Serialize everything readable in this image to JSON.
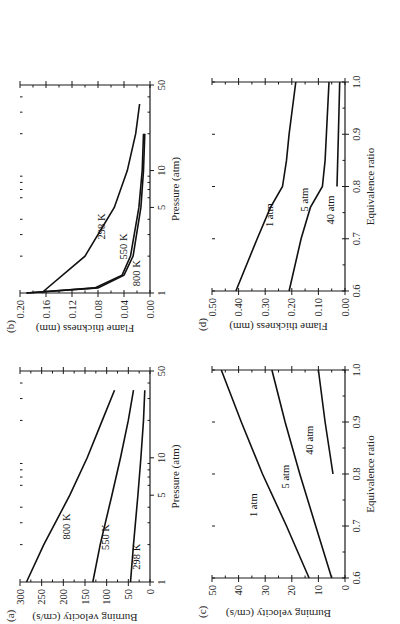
{
  "page": {
    "orientation": "rotated-90-ccw",
    "caption_visible": false
  },
  "chart_data": [
    {
      "id": "a",
      "panel_label": "(a)",
      "type": "line",
      "xlabel": "Pressure (atm)",
      "ylabel": "Burning velocity (cm/s)",
      "xscale": "log",
      "xlim": [
        1,
        50
      ],
      "ylim": [
        0,
        300
      ],
      "xticks": [
        1,
        5,
        10,
        50
      ],
      "yticks": [
        0,
        50,
        100,
        150,
        200,
        250,
        300
      ],
      "series": [
        {
          "name": "800 K",
          "x": [
            1,
            2,
            5,
            10,
            20,
            35
          ],
          "y": [
            285,
            245,
            185,
            145,
            110,
            82
          ]
        },
        {
          "name": "550 K",
          "x": [
            1,
            2,
            5,
            10,
            20,
            35
          ],
          "y": [
            132,
            115,
            88,
            68,
            50,
            38
          ]
        },
        {
          "name": "298 K",
          "x": [
            1,
            2,
            5,
            10,
            20,
            35
          ],
          "y": [
            45,
            38,
            28,
            21,
            15,
            12
          ]
        }
      ]
    },
    {
      "id": "b",
      "panel_label": "(b)",
      "type": "line",
      "xlabel": "Pressure (atm)",
      "ylabel": "Flame thickness (mm)",
      "xscale": "log",
      "xlim": [
        1,
        50
      ],
      "ylim": [
        0,
        0.2
      ],
      "xticks": [
        1,
        5,
        10,
        50
      ],
      "yticks": [
        "0.00",
        "0.04",
        "0.08",
        "0.12",
        "0.16",
        "0.20"
      ],
      "series": [
        {
          "name": "298 K",
          "x": [
            1,
            2,
            5,
            10,
            20,
            35
          ],
          "y": [
            0.167,
            0.1,
            0.055,
            0.035,
            0.022,
            0.016
          ]
        },
        {
          "name": "550 K",
          "x": [
            1,
            1.1,
            1.4,
            2,
            5,
            10,
            20
          ],
          "y": [
            0.19,
            0.085,
            0.043,
            0.03,
            0.017,
            0.012,
            0.01
          ]
        },
        {
          "name": "800 K",
          "x": [
            1,
            1.1,
            1.4,
            2,
            5,
            10,
            20
          ],
          "y": [
            0.19,
            0.08,
            0.04,
            0.026,
            0.014,
            0.01,
            0.008
          ]
        }
      ]
    },
    {
      "id": "c",
      "panel_label": "(c)",
      "type": "line",
      "xlabel": "Equivalence ratio",
      "ylabel": "Burning velocity (cm/s)",
      "xlim": [
        0.6,
        1.0
      ],
      "ylim": [
        0,
        50
      ],
      "xticks": [
        "0.6",
        "0.7",
        "0.8",
        "0.9",
        "1.0"
      ],
      "yticks": [
        0,
        10,
        20,
        30,
        40,
        50
      ],
      "series": [
        {
          "name": "1 atm",
          "x": [
            0.6,
            0.7,
            0.8,
            0.9,
            1.0
          ],
          "y": [
            13.5,
            22,
            31,
            39,
            46.5
          ]
        },
        {
          "name": "5 atm",
          "x": [
            0.6,
            0.7,
            0.8,
            0.9,
            1.0
          ],
          "y": [
            5,
            11,
            17,
            22.5,
            27.5
          ]
        },
        {
          "name": "40 atm",
          "x": [
            0.8,
            0.9,
            1.0
          ],
          "y": [
            4.5,
            7.5,
            10
          ]
        }
      ]
    },
    {
      "id": "d",
      "panel_label": "(d)",
      "type": "line",
      "xlabel": "Equivalence ratio",
      "ylabel": "Flame thickness (mm)",
      "xlim": [
        0.6,
        1.0
      ],
      "ylim": [
        0,
        0.5
      ],
      "xticks": [
        "0.6",
        "0.7",
        "0.8",
        "0.9",
        "1.0"
      ],
      "yticks": [
        "0.00",
        "0.10",
        "0.20",
        "0.30",
        "0.40",
        "0.50"
      ],
      "series": [
        {
          "name": "1 atm",
          "x": [
            0.6,
            0.7,
            0.76,
            0.8,
            0.85,
            0.9,
            1.0
          ],
          "y": [
            0.41,
            0.33,
            0.28,
            0.235,
            0.22,
            0.21,
            0.185
          ]
        },
        {
          "name": "5 atm",
          "x": [
            0.6,
            0.7,
            0.76,
            0.8,
            0.85,
            0.9,
            1.0
          ],
          "y": [
            0.21,
            0.165,
            0.13,
            0.085,
            0.075,
            0.07,
            0.06
          ]
        },
        {
          "name": "40 atm",
          "x": [
            0.8,
            0.9,
            1.0
          ],
          "y": [
            0.03,
            0.025,
            0.02
          ]
        }
      ]
    }
  ]
}
